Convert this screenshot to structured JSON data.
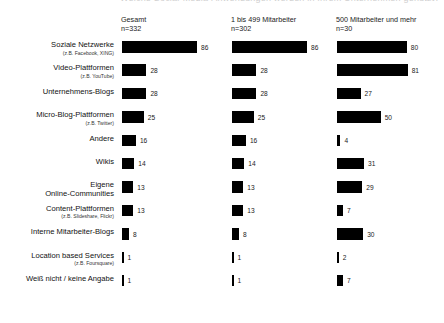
{
  "top_clipped_text": "Welche Social-Media-Anwendungen werden in Ihrem Unternehmen genutzt?",
  "columns": [
    {
      "title": "Gesamt",
      "n": "n=332",
      "key": "gesamt"
    },
    {
      "title": "1 bis 499 Mitarbeiter",
      "n": "n=302",
      "key": "kmu"
    },
    {
      "title": "500 Mitarbeiter und mehr",
      "n": "n=30",
      "key": "gross"
    }
  ],
  "categories": [
    {
      "label": "Soziale Netzwerke",
      "sub": "(z.B. Facebook, XING)"
    },
    {
      "label": "Video-Plattformen",
      "sub": "(z.B. YouTube)"
    },
    {
      "label": "Unternehmens-Blogs",
      "sub": ""
    },
    {
      "label": "Micro-Blog-Plattformen",
      "sub": "(z.B. Twitter)"
    },
    {
      "label": "Andere",
      "sub": ""
    },
    {
      "label": "Wikis",
      "sub": ""
    },
    {
      "label": "Eigene\nOnline-Communities",
      "sub": ""
    },
    {
      "label": "Content-Plattformen",
      "sub": "(z.B. Slideshare, Flickr)"
    },
    {
      "label": "Interne Mitarbeiter-Blogs",
      "sub": ""
    },
    {
      "label": "Location based Services",
      "sub": "(z.B. Foursquare)"
    },
    {
      "label": "Weiß nicht / keine Angabe",
      "sub": ""
    }
  ],
  "chart_data": {
    "type": "bar",
    "title": "Welche Social-Media-Anwendungen werden in Ihrem Unternehmen genutzt?",
    "xlabel": "",
    "ylabel": "",
    "xlim": [
      0,
      100
    ],
    "grid": false,
    "orientation": "horizontal",
    "value_unit": "percent",
    "legend_position": "column-headers",
    "categories": [
      "Soziale Netzwerke (z.B. Facebook, XING)",
      "Video-Plattformen (z.B. YouTube)",
      "Unternehmens-Blogs",
      "Micro-Blog-Plattformen (z.B. Twitter)",
      "Andere",
      "Wikis",
      "Eigene Online-Communities",
      "Content-Plattformen (z.B. Slideshare, Flickr)",
      "Interne Mitarbeiter-Blogs",
      "Location based Services (z.B. Foursquare)",
      "Weiß nicht / keine Angabe"
    ],
    "series": [
      {
        "name": "Gesamt",
        "n": 332,
        "values": [
          86,
          28,
          28,
          25,
          16,
          14,
          13,
          13,
          8,
          1,
          1
        ]
      },
      {
        "name": "1 bis 499 Mitarbeiter",
        "n": 302,
        "values": [
          86,
          28,
          28,
          25,
          16,
          14,
          13,
          13,
          8,
          1,
          1
        ]
      },
      {
        "name": "500 Mitarbeiter und mehr",
        "n": 30,
        "values": [
          80,
          81,
          27,
          50,
          4,
          31,
          29,
          7,
          30,
          2,
          7
        ]
      }
    ]
  },
  "style": {
    "bar_color": "#000000",
    "background": "#ffffff",
    "text_color": "#1a1a1a"
  }
}
